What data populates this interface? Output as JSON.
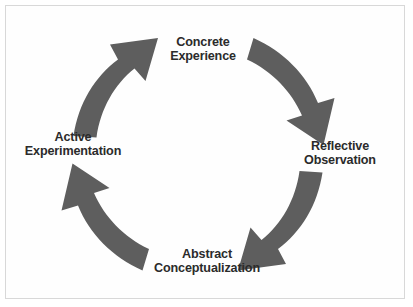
{
  "diagram": {
    "type": "cycle",
    "background_color": "#fefefe",
    "border_color": "#d8d8d8",
    "arrow_color": "#5e5e5e",
    "text_color": "#2b2b2b",
    "nodes": [
      {
        "id": "concrete-experience",
        "position": "top",
        "line1": "Concrete",
        "line2": "Experience"
      },
      {
        "id": "reflective-observation",
        "position": "right",
        "line1": "Reflective",
        "line2": "Observation"
      },
      {
        "id": "abstract-conceptualization",
        "position": "bottom",
        "line1": "Abstract",
        "line2": "Conceptualization"
      },
      {
        "id": "active-experimentation",
        "position": "left",
        "line1": "Active",
        "line2": "Experimentation"
      }
    ],
    "arrows": [
      {
        "id": "arrow-top-right",
        "from": "concrete-experience",
        "to": "reflective-observation",
        "direction": "clockwise"
      },
      {
        "id": "arrow-bottom-right",
        "from": "reflective-observation",
        "to": "abstract-conceptualization",
        "direction": "clockwise"
      },
      {
        "id": "arrow-bottom-left",
        "from": "abstract-conceptualization",
        "to": "active-experimentation",
        "direction": "clockwise"
      },
      {
        "id": "arrow-top-left",
        "from": "active-experimentation",
        "to": "concrete-experience",
        "direction": "clockwise"
      }
    ]
  }
}
